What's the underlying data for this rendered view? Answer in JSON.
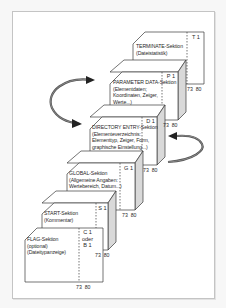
{
  "diagram": {
    "type": "stacked-file-sections",
    "colors": {
      "stroke": "#3a3a3a",
      "face": "#ffffff",
      "top": "#ffffff",
      "side": "#d9d9d9",
      "arrow": "#555555",
      "frame": "#c4c4c4"
    },
    "sections": [
      {
        "id": "terminate",
        "title": "TERMINATE-Sektion",
        "lines": [
          "(Dateistatistik)"
        ],
        "code": [
          "T 1"
        ],
        "columns": "73  80"
      },
      {
        "id": "parameter",
        "title": "PARAMETER DATA-Sektion",
        "lines": [
          "(Elementdaten;",
          "Koordinaten, Zeiger,",
          "Werte...)"
        ],
        "code": [
          "P 1"
        ],
        "columns": "73  80"
      },
      {
        "id": "directory",
        "title": "DIRECTORY ENTRY-Sektion",
        "lines": [
          "(Elementeverzeichnis:",
          "Elementtyp, Zeiger, Form,",
          "graphische Einstellung...)"
        ],
        "code": [
          "D 1"
        ],
        "columns": "73  80"
      },
      {
        "id": "global",
        "title": "GLOBAL-Sektion",
        "lines": [
          "(Allgemeine Angaben:",
          "Wertebereich, Datum...)"
        ],
        "code": [
          "G 1"
        ],
        "columns": "73  80"
      },
      {
        "id": "start",
        "title": "START-Sektion",
        "lines": [
          "(Kommentar)"
        ],
        "code": [
          "S 1"
        ],
        "columns": "73  80"
      },
      {
        "id": "flag",
        "title": "FLAG-Sektion",
        "lines": [
          "(optional)",
          "(Dateitypanzeige)"
        ],
        "code": [
          "C 1",
          "oder",
          "B 1"
        ],
        "columns": "73  80"
      }
    ],
    "arrows": [
      {
        "id": "loop-left",
        "from": "directory",
        "to": "parameter",
        "direction": "bidirectional"
      },
      {
        "id": "loop-right",
        "from": "global",
        "to": "directory",
        "direction": "pointing-left-to-directory"
      }
    ]
  }
}
